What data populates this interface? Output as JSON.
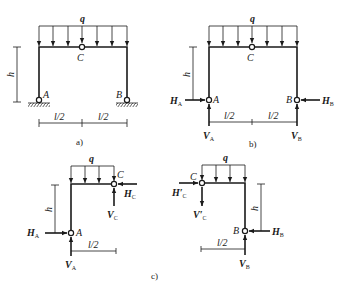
{
  "figure": {
    "panels": [
      {
        "id": "a",
        "caption": "a)",
        "load_label": "q",
        "hinge_labels": {
          "A": "A",
          "B": "B",
          "C": "C"
        },
        "height_label": "h",
        "span_labels": [
          "l/2",
          "l/2"
        ],
        "supports": "pinned-ground"
      },
      {
        "id": "b",
        "caption": "b)",
        "load_label": "q",
        "hinge_labels": {
          "A": "A",
          "B": "B",
          "C": "C"
        },
        "height_label": "h",
        "span_labels": [
          "l/2",
          "l/2"
        ],
        "reactions": {
          "HA": "H",
          "HA_sub": "A",
          "VA": "V",
          "VA_sub": "A",
          "HB": "H",
          "HB_sub": "B",
          "VB": "V",
          "VB_sub": "B"
        }
      },
      {
        "id": "c",
        "caption": "c)",
        "left": {
          "load_label": "q",
          "hinge_labels": {
            "A": "A",
            "C": "C"
          },
          "height_label": "h",
          "span_label": "l/2",
          "forces": {
            "HA": "H",
            "HA_sub": "A",
            "VA": "V",
            "VA_sub": "A",
            "HC": "H",
            "HC_sub": "C",
            "VC": "V",
            "VC_sub": "C"
          }
        },
        "right": {
          "load_label": "q",
          "hinge_labels": {
            "B": "B",
            "C": "C"
          },
          "height_label": "h",
          "span_label": "l/2",
          "forces": {
            "HC": "H′",
            "HC_sub": "C",
            "VC": "V′",
            "VC_sub": "C",
            "HB": "H",
            "HB_sub": "B",
            "VB": "V",
            "VB_sub": "B"
          }
        }
      }
    ]
  }
}
